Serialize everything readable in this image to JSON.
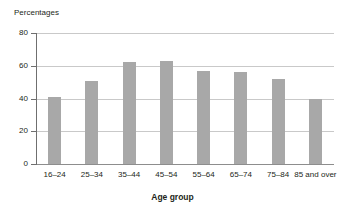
{
  "chart_data": {
    "type": "bar",
    "title": "",
    "ylabel": "Percentages",
    "xlabel": "Age group",
    "categories": [
      "16–24",
      "25–34",
      "35–44",
      "45–54",
      "55–64",
      "65–74",
      "75–84",
      "85 and over"
    ],
    "values": [
      41,
      51,
      62,
      63,
      57,
      56,
      52,
      40
    ],
    "ylim": [
      0,
      80
    ],
    "yticks": [
      0,
      20,
      40,
      60,
      80
    ],
    "ytick_labels": [
      "0",
      "20",
      "40",
      "60",
      "80"
    ],
    "grid": true,
    "legend": false,
    "bar_color": "#a8a8a8",
    "gridline_color": "#c9c9c9",
    "axis_color": "#6f6f6f"
  },
  "axis": {
    "y_caption": "Percentages",
    "x_title": "Age group"
  }
}
